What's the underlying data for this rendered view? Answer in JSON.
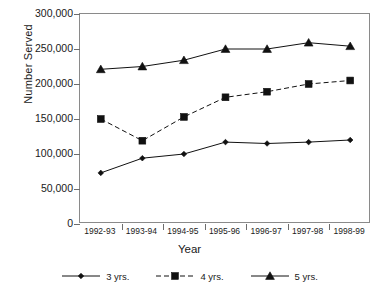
{
  "chart_data": {
    "type": "line",
    "title": "",
    "xlabel": "Year",
    "ylabel": "Number Served",
    "categories": [
      "1992-93",
      "1993-94",
      "1994-95",
      "1995-96",
      "1996-97",
      "1997-98",
      "1998-99"
    ],
    "ylim": [
      0,
      300000
    ],
    "yticks": [
      0,
      50000,
      100000,
      150000,
      200000,
      250000,
      300000
    ],
    "ytick_labels": [
      "0",
      "50,000",
      "100,000",
      "150,000",
      "200,000",
      "250,000",
      "300,000"
    ],
    "grid": false,
    "legend_position": "bottom",
    "series": [
      {
        "name": "3 yrs.",
        "marker": "diamond",
        "linestyle": "solid",
        "color": "#111111",
        "values": [
          73000,
          94000,
          100000,
          117000,
          115000,
          117000,
          120000
        ]
      },
      {
        "name": "4 yrs.",
        "marker": "square",
        "linestyle": "dashed",
        "color": "#111111",
        "values": [
          150000,
          119000,
          153000,
          181000,
          189000,
          200000,
          205000
        ]
      },
      {
        "name": "5 yrs.",
        "marker": "triangle",
        "linestyle": "solid",
        "color": "#111111",
        "values": [
          221000,
          225000,
          234000,
          250000,
          250000,
          259000,
          254000
        ]
      }
    ]
  },
  "legend": {
    "items": [
      {
        "label": "3 yrs.",
        "marker": "diamond-marker",
        "linestyle": "solid"
      },
      {
        "label": "4 yrs.",
        "marker": "square-marker",
        "linestyle": "dashed"
      },
      {
        "label": "5 yrs.",
        "marker": "triangle-marker",
        "linestyle": "solid"
      }
    ]
  },
  "axis": {
    "frame_color": "#8a8a8a",
    "tick_color": "#6d6d6d",
    "text_color": "#1a1a1a"
  }
}
